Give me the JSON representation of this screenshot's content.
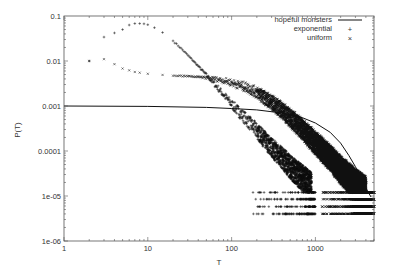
{
  "chart_data": {
    "type": "scatter",
    "title": "",
    "xlabel": "T",
    "ylabel": "P(T)",
    "xscale": "log",
    "yscale": "log",
    "xlim": [
      1,
      5000
    ],
    "ylim": [
      1e-06,
      0.1
    ],
    "grid": false,
    "legend_position": "top-right",
    "x_ticks": [
      {
        "value": 1,
        "label": "1"
      },
      {
        "value": 10,
        "label": "10"
      },
      {
        "value": 100,
        "label": "100"
      },
      {
        "value": 1000,
        "label": "1000"
      }
    ],
    "y_ticks": [
      {
        "value": 0.1,
        "label": "0.1"
      },
      {
        "value": 0.01,
        "label": "0.01"
      },
      {
        "value": 0.001,
        "label": "0.001"
      },
      {
        "value": 0.0001,
        "label": "0.0001"
      },
      {
        "value": 1e-05,
        "label": "1e-05"
      },
      {
        "value": 1e-06,
        "label": "1e-06"
      }
    ],
    "series": [
      {
        "name": "hopeful monsters",
        "style": "line",
        "marker": "",
        "points": [
          [
            1,
            0.001
          ],
          [
            10,
            0.00098
          ],
          [
            50,
            0.00093
          ],
          [
            100,
            0.00088
          ],
          [
            200,
            0.00082
          ],
          [
            400,
            0.0007
          ],
          [
            700,
            0.00055
          ],
          [
            1000,
            0.00042
          ],
          [
            1500,
            0.00026
          ],
          [
            2000,
            0.00015
          ],
          [
            2500,
            8e-05
          ],
          [
            3000,
            4.5e-05
          ],
          [
            3500,
            2.5e-05
          ],
          [
            4000,
            1.5e-05
          ],
          [
            4600,
            9.5e-06
          ]
        ]
      },
      {
        "name": "exponential",
        "style": "points",
        "marker": "+",
        "points": [
          [
            2,
            0.01
          ],
          [
            3,
            0.034
          ],
          [
            4,
            0.042
          ],
          [
            5,
            0.05
          ],
          [
            6,
            0.063
          ],
          [
            7,
            0.068
          ],
          [
            8,
            0.068
          ],
          [
            9,
            0.067
          ],
          [
            10,
            0.064
          ],
          [
            12,
            0.055
          ],
          [
            15,
            0.043
          ],
          [
            20,
            0.028
          ],
          [
            25,
            0.019
          ],
          [
            30,
            0.0135
          ],
          [
            40,
            0.0077
          ],
          [
            50,
            0.0049
          ],
          [
            70,
            0.0024
          ],
          [
            100,
            0.0011
          ],
          [
            150,
            0.0005
          ],
          [
            200,
            0.00028
          ],
          [
            300,
            0.00012
          ],
          [
            400,
            7e-05
          ],
          [
            500,
            4.5e-05
          ],
          [
            700,
            2.5e-05
          ],
          [
            900,
            1.6e-05
          ]
        ],
        "floor_bands": [
          4e-06,
          5.8e-06,
          8.5e-06,
          1.2e-05
        ]
      },
      {
        "name": "uniform",
        "style": "points",
        "marker": "×",
        "points": [
          [
            2,
            0.01
          ],
          [
            3,
            0.011
          ],
          [
            4,
            0.0085
          ],
          [
            5,
            0.0068
          ],
          [
            6,
            0.0062
          ],
          [
            7,
            0.0057
          ],
          [
            8,
            0.0055
          ],
          [
            10,
            0.0052
          ],
          [
            15,
            0.0049
          ],
          [
            20,
            0.0047
          ],
          [
            30,
            0.0046
          ],
          [
            40,
            0.0044
          ],
          [
            60,
            0.0041
          ],
          [
            80,
            0.0037
          ],
          [
            100,
            0.0033
          ],
          [
            150,
            0.0026
          ],
          [
            200,
            0.002
          ],
          [
            300,
            0.0012
          ],
          [
            400,
            0.0008
          ],
          [
            500,
            0.00055
          ],
          [
            700,
            0.0003
          ],
          [
            1000,
            0.00015
          ],
          [
            1500,
            7e-05
          ],
          [
            2000,
            3.8e-05
          ],
          [
            3000,
            1.8e-05
          ],
          [
            4000,
            1.2e-05
          ]
        ],
        "floor_bands": [
          4e-06,
          5.8e-06,
          8.5e-06,
          1.2e-05
        ]
      }
    ]
  },
  "legend": {
    "items": [
      {
        "label": "hopeful monsters",
        "symbol": "line"
      },
      {
        "label": "exponential",
        "symbol": "+"
      },
      {
        "label": "uniform",
        "symbol": "×"
      }
    ]
  },
  "axes": {
    "xlabel": "T",
    "ylabel": "P(T)"
  }
}
